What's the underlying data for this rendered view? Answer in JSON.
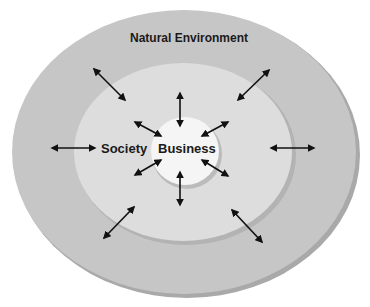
{
  "diagram": {
    "type": "concentric-ellipses",
    "rings": [
      {
        "name": "Natural Environment",
        "color": "#c4c4c4",
        "shadow": "#a9a9a9"
      },
      {
        "name": "Society",
        "color": "#dedede",
        "shadow": "#b5b5b5"
      },
      {
        "name": "Business",
        "color": "#f4f4f4",
        "shadow": "#bdbdbd"
      }
    ],
    "labels": {
      "outer": "Natural Environment",
      "middle": "Society",
      "inner": "Business"
    },
    "arrow_style": "double-headed",
    "arrow_color": "#111111"
  }
}
